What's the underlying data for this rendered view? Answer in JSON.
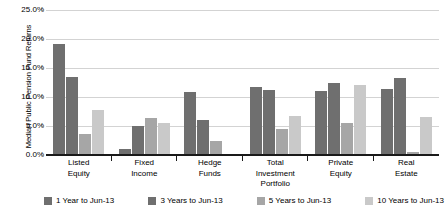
{
  "chart_data": {
    "type": "bar",
    "title": "",
    "xlabel": "",
    "ylabel": "Median Public Pension Fund Returns",
    "ylim": [
      0,
      25
    ],
    "ytick_labels": [
      "25.0%",
      "20.0%",
      "15.0%",
      "10.0%",
      "5.0%",
      "0.0%"
    ],
    "ytick_values": [
      25,
      20,
      15,
      10,
      5,
      0
    ],
    "grid": true,
    "legend_position": "bottom",
    "categories": [
      "Listed Equity",
      "Fixed Income",
      "Hedge Funds",
      "Total Investment Portfolio",
      "Private Equity",
      "Real Estate"
    ],
    "category_lines": [
      [
        "Listed",
        "Equity"
      ],
      [
        "Fixed",
        "Income"
      ],
      [
        "Hedge",
        "Funds"
      ],
      [
        "Total",
        "Investment",
        "Portfolio"
      ],
      [
        "Private",
        "Equity"
      ],
      [
        "Real",
        "Estate"
      ]
    ],
    "series": [
      {
        "name": "1 Year to Jun-13",
        "color": "#6f6f6f",
        "values": [
          19.1,
          1.0,
          10.9,
          11.8,
          11.0,
          11.3
        ]
      },
      {
        "name": "3 Years to Jun-13",
        "color": "#6f6f6f",
        "values": [
          13.4,
          5.0,
          6.0,
          11.2,
          12.4,
          13.3
        ]
      },
      {
        "name": "5 Years to Jun-13",
        "color": "#a6a6a6",
        "values": [
          3.6,
          6.3,
          2.5,
          4.5,
          5.6,
          0.6
        ]
      },
      {
        "name": "10 Years to Jun-13",
        "color": "#c9c9c9",
        "values": [
          7.7,
          5.5,
          null,
          6.7,
          12.0,
          6.5
        ]
      }
    ]
  },
  "legend": {
    "items": [
      {
        "label": "1 Year to Jun-13",
        "color": "#6f6f6f"
      },
      {
        "label": "3 Years to Jun-13",
        "color": "#6f6f6f"
      },
      {
        "label": "5 Years to Jun-13",
        "color": "#a6a6a6"
      },
      {
        "label": "10 Years to Jun-13",
        "color": "#c9c9c9"
      }
    ]
  },
  "axis": {
    "y_title": "Median Public Pension Fund Returns"
  }
}
